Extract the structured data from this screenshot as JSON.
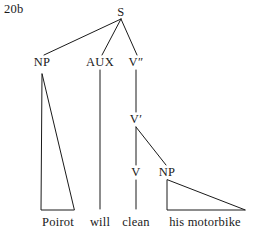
{
  "figure": {
    "label": "20b",
    "background_color": "#ffffff",
    "ink_color": "#1a1a1a",
    "width": 256,
    "height": 238
  },
  "tree": {
    "nodes": [
      {
        "id": "S",
        "label": "S",
        "x": 121,
        "y": 12
      },
      {
        "id": "NP1",
        "label": "NP",
        "x": 42,
        "y": 62
      },
      {
        "id": "AUX",
        "label": "AUX",
        "x": 100,
        "y": 62
      },
      {
        "id": "V2",
        "label": "V″",
        "x": 136,
        "y": 62
      },
      {
        "id": "V1",
        "label": "V′",
        "x": 136,
        "y": 119
      },
      {
        "id": "V0",
        "label": "V",
        "x": 136,
        "y": 172
      },
      {
        "id": "NP2",
        "label": "NP",
        "x": 167,
        "y": 172
      }
    ],
    "edges": [
      {
        "from": "S",
        "to": "NP1",
        "type": "line"
      },
      {
        "from": "S",
        "to": "AUX",
        "type": "line"
      },
      {
        "from": "S",
        "to": "V2",
        "type": "line"
      },
      {
        "from": "V2",
        "to": "V1",
        "type": "line"
      },
      {
        "from": "V1",
        "to": "V0",
        "type": "line"
      },
      {
        "from": "V1",
        "to": "NP2",
        "type": "line"
      },
      {
        "from": "AUX",
        "to": "will-leaf",
        "type": "line"
      },
      {
        "from": "V0",
        "to": "clean-leaf",
        "type": "line"
      }
    ],
    "triangles": [
      {
        "node": "NP1",
        "apex_x": 42,
        "apex_y": 74,
        "base_left_x": 41,
        "base_right_x": 74,
        "base_y": 210
      },
      {
        "node": "NP2",
        "apex_x": 167,
        "apex_y": 180,
        "base_left_x": 167,
        "base_right_x": 245,
        "base_y": 210
      }
    ],
    "leaves": [
      {
        "id": "poirot-leaf",
        "text": "Poirot",
        "x": 58,
        "y": 216,
        "parent": "NP1"
      },
      {
        "id": "will-leaf",
        "text": "will",
        "x": 100,
        "y": 216,
        "parent": "AUX"
      },
      {
        "id": "clean-leaf",
        "text": "clean",
        "x": 136,
        "y": 216,
        "parent": "V0"
      },
      {
        "id": "motorbike-leaf",
        "text": "his motorbike",
        "x": 205,
        "y": 216,
        "parent": "NP2"
      }
    ],
    "sentence": "Poirot will clean his motorbike"
  }
}
